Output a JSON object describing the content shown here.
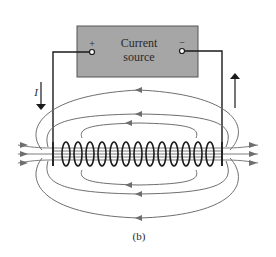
{
  "figure": {
    "caption": "(b)",
    "colors": {
      "background": "#ffffff",
      "box_fill": "#a6a6a6",
      "box_stroke": "#555555",
      "wire": "#1a1a1a",
      "field_line": "#6e6e6e"
    }
  },
  "source": {
    "label_line1": "Current",
    "label_line2": "source",
    "plus_symbol": "+",
    "minus_symbol": "−"
  },
  "current": {
    "label": "I",
    "left_arrow_direction": "down",
    "right_arrow_direction": "up"
  },
  "solenoid": {
    "turns": 13,
    "field_direction_inside": "left-to-right",
    "field_direction_outside": "right-to-left"
  }
}
